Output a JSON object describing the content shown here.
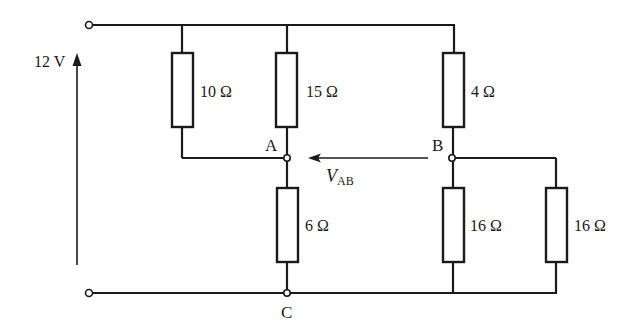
{
  "diagram": {
    "title": "",
    "type": "resistor bridge circuit",
    "source": {
      "label": "12 V",
      "voltage": 12,
      "unit": "V"
    },
    "resistors": [
      {
        "id": "R1",
        "label": "10 Ω",
        "ohms": 10,
        "between": [
          "top rail",
          "A"
        ]
      },
      {
        "id": "R2",
        "label": "15 Ω",
        "ohms": 15,
        "between": [
          "top rail",
          "A"
        ]
      },
      {
        "id": "R3",
        "label": "4 Ω",
        "ohms": 4,
        "between": [
          "top rail",
          "B"
        ]
      },
      {
        "id": "R4",
        "label": "6 Ω",
        "ohms": 6,
        "between": [
          "A",
          "C"
        ]
      },
      {
        "id": "R5",
        "label": "16 Ω",
        "ohms": 16,
        "between": [
          "B",
          "C"
        ]
      },
      {
        "id": "R6",
        "label": "16 Ω",
        "ohms": 16,
        "between": [
          "B",
          "C"
        ]
      }
    ],
    "nodes": {
      "A": "A",
      "B": "B",
      "C": "C"
    },
    "measurement": {
      "symbol": "V",
      "subscript": "AB",
      "direction": "arrow from B to A"
    },
    "colors": {
      "ink": "#1a1a1a",
      "background": "#ffffff"
    }
  }
}
